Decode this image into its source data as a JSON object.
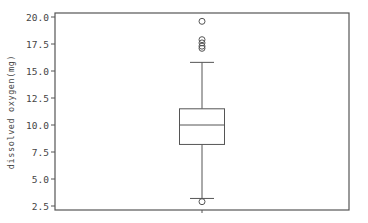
{
  "chart_data": {
    "type": "box",
    "title": "",
    "xlabel": "",
    "ylabel": "dissolved oxygen(mg)",
    "ylim": [
      2.2,
      20.4
    ],
    "yticks": [
      2.5,
      5.0,
      7.5,
      10.0,
      12.5,
      15.0,
      17.5,
      20.0
    ],
    "ytick_labels": [
      "2.5",
      "5.0",
      "7.5",
      "10.0",
      "12.5",
      "15.0",
      "17.5",
      "20.0"
    ],
    "grid": false,
    "legend": null,
    "series": [
      {
        "name": "dissolved oxygen(mg)",
        "whisker_low": 3.2,
        "q1": 8.2,
        "median": 10.0,
        "q3": 11.5,
        "whisker_high": 15.8,
        "outliers": [
          19.6,
          17.9,
          17.6,
          17.3,
          17.1,
          2.9
        ]
      }
    ]
  },
  "colors": {
    "frame": "#555555",
    "box": "#555555",
    "text": "#444444",
    "background": "#ffffff"
  }
}
